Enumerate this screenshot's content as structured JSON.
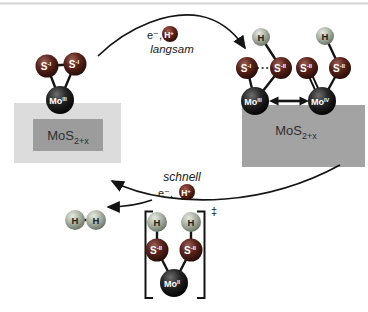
{
  "top_step": {
    "electron": "e⁻,",
    "proton": {
      "base": "H",
      "sup": "+"
    },
    "rate": "langsam"
  },
  "bottom_step": {
    "electron": "e⁻,",
    "proton": {
      "base": "H",
      "sup": "+"
    },
    "rate": "schnell"
  },
  "initial_complex": {
    "s_left": {
      "base": "S",
      "sup": "-I"
    },
    "s_right": {
      "base": "S",
      "sup": "-I"
    },
    "mo": {
      "base": "Mo",
      "sup": "III"
    },
    "substrate": {
      "base": "MoS",
      "sub": "2+x"
    }
  },
  "resonance_a": {
    "h": "H",
    "s_left": {
      "base": "S",
      "sup": "-I"
    },
    "s_right": {
      "base": "S",
      "sup": "-II"
    },
    "mo": {
      "base": "Mo",
      "sup": "III"
    }
  },
  "resonance_b": {
    "h": "H",
    "s_left": {
      "base": "S",
      "sup": "-II"
    },
    "s_right": {
      "base": "S",
      "sup": "-II"
    },
    "mo": {
      "base": "Mo",
      "sup": "IV"
    }
  },
  "right_substrate": {
    "base": "MoS",
    "sub": "2+x"
  },
  "transition_state": {
    "h_left": "H",
    "h_right": "H",
    "s_left": {
      "base": "S",
      "sup": "-II"
    },
    "s_right": {
      "base": "S",
      "sup": "-II"
    },
    "mo": {
      "base": "Mo",
      "sup": "II"
    },
    "dagger": "‡"
  },
  "product": {
    "h1": "H",
    "h2": "H"
  },
  "colors": {
    "sulfur": "#5c241b",
    "molybdenum": "#0a0a0a",
    "hydrogen": "#a9b2a3",
    "proton": "#63241a",
    "substrate_inner": "#9c9c9c",
    "substrate_outer": "#dcdcdc",
    "substrate_right": "#a3a3a3",
    "bond": "#141414"
  }
}
